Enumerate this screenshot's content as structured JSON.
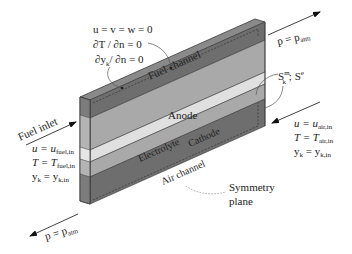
{
  "diagram": {
    "type": "schematic-3d-slab",
    "colors": {
      "channel": "#6e6e6e",
      "channel_top": "#8a8a8a",
      "electrode": "#a9a9a9",
      "electrolyte": "#e0e0e0",
      "front_face": "#b8b8b8",
      "outline": "#3a3a3a",
      "text": "#222222"
    },
    "layers": [
      {
        "id": "fuel-channel",
        "label": "Fuel channel"
      },
      {
        "id": "anode",
        "label": "Anode"
      },
      {
        "id": "electrolyte",
        "label": "Electrolyte"
      },
      {
        "id": "cathode",
        "label": "Cathode"
      },
      {
        "id": "air-channel",
        "label": "Air channel"
      }
    ],
    "wall_bc": {
      "line1": "u = v = w = 0",
      "line2": "∂T / ∂n = 0",
      "line3_main": "∂y",
      "line3_sub": "k",
      "line3_rest": "/ ∂n = 0"
    },
    "outlet_top": {
      "lhs": "p = p",
      "sub": "atm"
    },
    "outlet_bottom": {
      "lhs": "p = p",
      "sub": "atm"
    },
    "source_terms": {
      "s1": "S",
      "s1_sup": "m",
      "s1_sub": "k",
      "sep": " ; ",
      "s2": "S",
      "s2_sup": "e"
    },
    "fuel_inlet": {
      "title": "Fuel inlet",
      "u_lhs": "u = u",
      "u_sub": "fuel,in",
      "t_lhs": "T = T",
      "t_sub": "fuel,in",
      "y_lhs": "y",
      "y_lhs_sub": "k",
      "y_mid": " = y",
      "y_sub": "k,in"
    },
    "air_inlet": {
      "u_lhs": "u = u",
      "u_sub": "air,in",
      "t_lhs": "T = T",
      "t_sub": "air,in",
      "y_lhs": "y",
      "y_lhs_sub": "k",
      "y_mid": " = y",
      "y_sub": "k,in"
    },
    "symmetry": {
      "line1": "Symmetry",
      "line2": "plane"
    }
  }
}
